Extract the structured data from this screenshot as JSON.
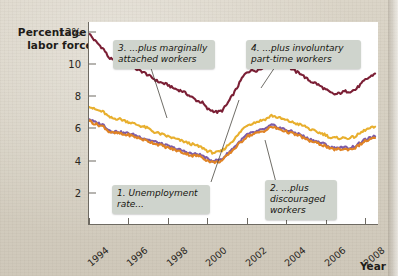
{
  "figure": {
    "ylabel": "Percentage of labor force",
    "xlabel": "Year",
    "background_color": "#d9d3c6",
    "panel_color": "#ffffff",
    "axis_color": "#6e6a62"
  },
  "annotations": [
    {
      "id": "note-1",
      "text": "1. Unemployment rate...",
      "series": "Unemployment rate"
    },
    {
      "id": "note-2",
      "text": "2. ...plus discouraged workers",
      "series": "plus discouraged workers"
    },
    {
      "id": "note-3",
      "text": "3. ...plus marginally attached workers",
      "series": "plus marginally attached workers"
    },
    {
      "id": "note-4",
      "text": "4. ...plus involuntary part-time workers",
      "series": "plus involuntary part-time workers"
    }
  ],
  "chart_data": {
    "type": "line",
    "title": "",
    "subtitle": "",
    "xlabel": "Year",
    "ylabel": "Percentage of labor force",
    "xlim": [
      1994,
      2008.7
    ],
    "ylim": [
      0,
      12.6
    ],
    "yticks": [
      2,
      4,
      6,
      8,
      10,
      12
    ],
    "ytick_labels": [
      "2",
      "4",
      "6",
      "8",
      "10",
      "12%"
    ],
    "xticks": [
      1994,
      1996,
      1998,
      2000,
      2002,
      2004,
      2006,
      2008
    ],
    "xtick_labels": [
      "1994",
      "1996",
      "1998",
      "2000",
      "2002",
      "2004",
      "2006",
      "2008"
    ],
    "grid": false,
    "legend": "none (inline callout labels)",
    "x": [
      1994.0,
      1994.25,
      1994.5,
      1994.75,
      1995.0,
      1995.25,
      1995.5,
      1995.75,
      1996.0,
      1996.25,
      1996.5,
      1996.75,
      1997.0,
      1997.25,
      1997.5,
      1997.75,
      1998.0,
      1998.25,
      1998.5,
      1998.75,
      1999.0,
      1999.25,
      1999.5,
      1999.75,
      2000.0,
      2000.25,
      2000.5,
      2000.75,
      2001.0,
      2001.25,
      2001.5,
      2001.75,
      2002.0,
      2002.25,
      2002.5,
      2002.75,
      2003.0,
      2003.25,
      2003.5,
      2003.75,
      2004.0,
      2004.25,
      2004.5,
      2004.75,
      2005.0,
      2005.25,
      2005.5,
      2005.75,
      2006.0,
      2006.25,
      2006.5,
      2006.75,
      2007.0,
      2007.25,
      2007.5,
      2007.75,
      2008.0,
      2008.25,
      2008.5
    ],
    "series": [
      {
        "name": "4. ...plus involuntary part-time workers (U-6)",
        "color": "#7b1f35",
        "values": [
          11.9,
          11.5,
          11.2,
          10.9,
          10.4,
          10.2,
          10.3,
          10.1,
          10.0,
          9.8,
          9.6,
          9.5,
          9.3,
          9.1,
          8.9,
          8.8,
          8.7,
          8.5,
          8.4,
          8.3,
          8.1,
          7.9,
          7.7,
          7.6,
          7.2,
          7.1,
          7.0,
          7.1,
          7.5,
          8.0,
          8.5,
          9.1,
          9.5,
          9.6,
          9.6,
          9.7,
          10.1,
          10.3,
          10.2,
          10.0,
          9.9,
          9.7,
          9.5,
          9.4,
          9.1,
          8.9,
          8.8,
          8.6,
          8.4,
          8.2,
          8.1,
          8.2,
          8.3,
          8.3,
          8.4,
          8.7,
          9.0,
          9.2,
          9.4
        ]
      },
      {
        "name": "3. ...plus marginally attached workers (U-5)",
        "color": "#e8af2e",
        "values": [
          7.4,
          7.2,
          7.1,
          7.0,
          6.7,
          6.6,
          6.6,
          6.5,
          6.4,
          6.3,
          6.2,
          6.1,
          6.0,
          5.8,
          5.7,
          5.6,
          5.5,
          5.4,
          5.3,
          5.2,
          5.1,
          5.0,
          4.9,
          4.8,
          4.6,
          4.5,
          4.5,
          4.6,
          4.9,
          5.2,
          5.5,
          5.9,
          6.2,
          6.3,
          6.4,
          6.5,
          6.6,
          6.8,
          6.7,
          6.6,
          6.5,
          6.4,
          6.3,
          6.2,
          6.1,
          5.9,
          5.8,
          5.7,
          5.6,
          5.4,
          5.4,
          5.4,
          5.4,
          5.4,
          5.5,
          5.7,
          5.9,
          6.0,
          6.1
        ]
      },
      {
        "name": "2. ...plus discouraged workers (U-4)",
        "color": "#7d5ba6",
        "values": [
          6.6,
          6.4,
          6.3,
          6.2,
          5.9,
          5.8,
          5.8,
          5.7,
          5.7,
          5.6,
          5.5,
          5.4,
          5.3,
          5.2,
          5.1,
          5.0,
          4.9,
          4.8,
          4.7,
          4.6,
          4.5,
          4.4,
          4.4,
          4.3,
          4.1,
          4.0,
          4.0,
          4.1,
          4.4,
          4.7,
          5.0,
          5.3,
          5.6,
          5.7,
          5.8,
          5.9,
          6.0,
          6.2,
          6.1,
          6.0,
          5.9,
          5.8,
          5.7,
          5.6,
          5.4,
          5.3,
          5.2,
          5.1,
          5.0,
          4.8,
          4.8,
          4.8,
          4.8,
          4.8,
          4.9,
          5.1,
          5.3,
          5.4,
          5.5
        ]
      },
      {
        "name": "1. Unemployment rate (U-3)",
        "color": "#e08324",
        "values": [
          6.5,
          6.3,
          6.2,
          6.1,
          5.8,
          5.7,
          5.7,
          5.6,
          5.6,
          5.5,
          5.4,
          5.3,
          5.2,
          5.1,
          5.0,
          4.9,
          4.8,
          4.7,
          4.6,
          4.5,
          4.4,
          4.3,
          4.3,
          4.2,
          4.0,
          3.9,
          3.9,
          4.0,
          4.3,
          4.6,
          4.9,
          5.2,
          5.5,
          5.6,
          5.7,
          5.8,
          5.9,
          6.1,
          6.0,
          5.9,
          5.8,
          5.7,
          5.6,
          5.5,
          5.3,
          5.2,
          5.1,
          5.0,
          4.9,
          4.7,
          4.7,
          4.7,
          4.7,
          4.7,
          4.8,
          5.0,
          5.2,
          5.3,
          5.4
        ]
      }
    ]
  }
}
